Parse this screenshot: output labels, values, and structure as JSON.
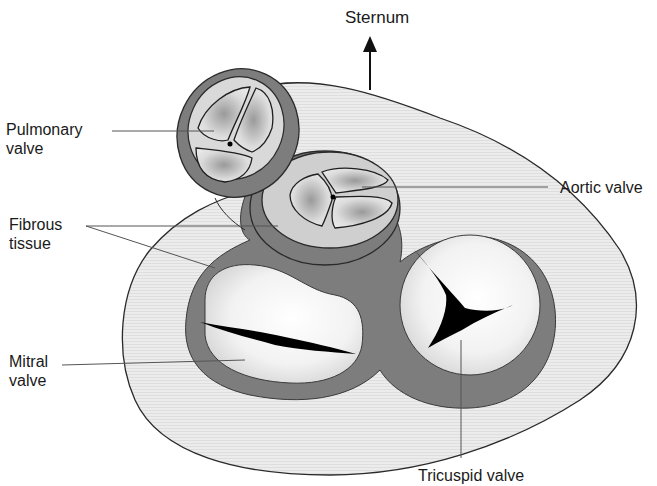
{
  "diagram": {
    "orientation": {
      "label": "Sternum",
      "arrow": "arrow-up-icon"
    },
    "labels": [
      {
        "id": "pulmonary",
        "text": "Pulmonary\nvalve"
      },
      {
        "id": "fibrous",
        "text": "Fibrous\ntissue"
      },
      {
        "id": "mitral",
        "text": "Mitral\nvalve"
      },
      {
        "id": "aortic",
        "text": "Aortic valve"
      },
      {
        "id": "tricuspid",
        "text": "Tricuspid valve"
      }
    ],
    "colors": {
      "background": "#ffffff",
      "outer_tissue": "#e9e9e9",
      "fibrous_ring": "#7d7d7d",
      "leaflet": "#d8d8d8",
      "valve_opening": "#000000",
      "outline": "#2a2a2a",
      "leader_line": "#555555"
    }
  }
}
